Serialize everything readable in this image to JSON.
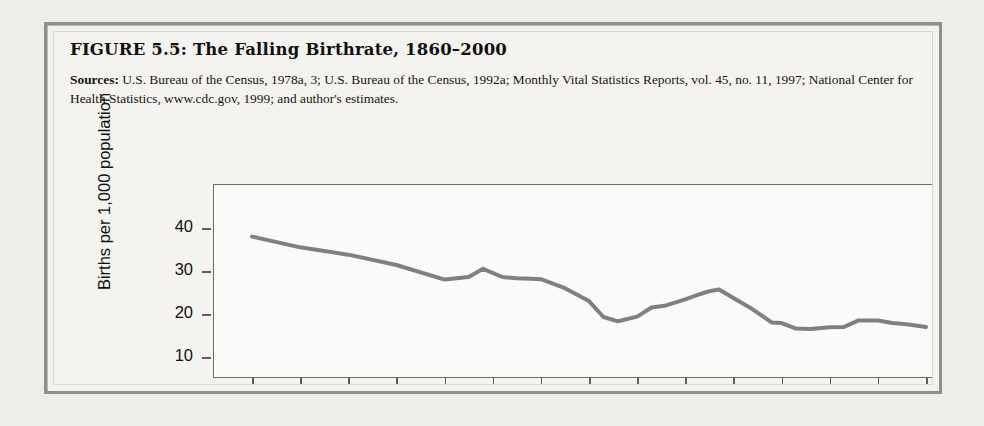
{
  "figure": {
    "title": "FIGURE 5.5:  The Falling Birthrate, 1860–2000",
    "sources_label": "Sources:",
    "sources_text": " U.S. Bureau of the Census, 1978a, 3; U.S. Bureau of the Census, 1992a; Monthly Vital Statistics Reports, vol. 45, no. 11, 1997; National Center for Health Statistics, www.cdc.gov, 1999; and author's estimates."
  },
  "chart_data": {
    "type": "line",
    "title": "The Falling Birthrate, 1860–2000",
    "xlabel": "",
    "ylabel": "Births per 1,000 population",
    "xlim": [
      1860,
      2000
    ],
    "ylim": [
      0,
      45
    ],
    "xticks": [
      1860,
      1870,
      1880,
      1890,
      1900,
      1910,
      1920,
      1930,
      1940,
      1950,
      1960,
      1970,
      1980,
      1990,
      2000
    ],
    "yticks": [
      10,
      20,
      30,
      40
    ],
    "grid": false,
    "legend": false,
    "line_color": "#808080",
    "line_width": 4,
    "series": [
      {
        "name": "Births per 1,000 population",
        "x": [
          1860,
          1870,
          1880,
          1890,
          1900,
          1905,
          1908,
          1912,
          1915,
          1918,
          1920,
          1925,
          1930,
          1933,
          1936,
          1940,
          1943,
          1946,
          1950,
          1953,
          1955,
          1957,
          1960,
          1964,
          1968,
          1970,
          1973,
          1976,
          1980,
          1983,
          1986,
          1990,
          1993,
          1996,
          2000
        ],
        "values": [
          38.0,
          35.5,
          33.8,
          31.4,
          28.0,
          28.6,
          30.5,
          28.6,
          28.3,
          28.2,
          28.1,
          26.0,
          23.0,
          19.3,
          18.3,
          19.4,
          21.5,
          22.0,
          23.4,
          24.6,
          25.3,
          25.7,
          23.7,
          21.1,
          18.0,
          17.9,
          16.6,
          16.5,
          16.9,
          17.0,
          18.5,
          18.5,
          17.9,
          17.6,
          17.0
        ]
      }
    ]
  },
  "axis": {
    "y_labels": [
      "40",
      "30",
      "20",
      "10"
    ],
    "x_labels": [
      "1860",
      "1870",
      "1880",
      "1890",
      "1900",
      "1910",
      "1920",
      "1930",
      "1940",
      "1950",
      "1960",
      "1970",
      "1980",
      "1990",
      "2000"
    ],
    "y_title": "Births per 1,000 population"
  }
}
